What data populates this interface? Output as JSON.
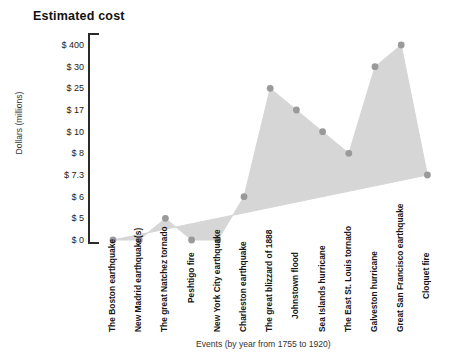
{
  "chart_data": {
    "type": "area",
    "title": "Estimated cost",
    "ylabel": "Dollars (millions)",
    "xlabel": "Events (by year from 1755 to 1920)",
    "ytick_labels": [
      "$ 400",
      "$ 30",
      "$ 25",
      "$ 17",
      "$ 10",
      "$ 8",
      "$ 7.3",
      "$ 6",
      "$ 5",
      "$ 0"
    ],
    "ytick_values": [
      400,
      30,
      25,
      17,
      10,
      8,
      7.3,
      6,
      5,
      0
    ],
    "scale_note": "ordinal / non-linear y axis: ticks evenly spaced",
    "grid": false,
    "legend": "none",
    "categories": [
      "The Boston earthquake",
      "New Madrid earthquake(s)",
      "The great Natchez tornado",
      "Peshtigo fire",
      "New York City earthquake",
      "Charleston earthquake",
      "The great blizzard of 1888",
      "Johnstown flood",
      "Sea Islands hurricane",
      "The East St. Louis tornado",
      "Galveston hurricane",
      "Great San Francisco earthquake",
      "Cloquet fire"
    ],
    "values": [
      0,
      0,
      5,
      0,
      0,
      6,
      25,
      17,
      10,
      8,
      30,
      400,
      7.3
    ],
    "value_labels": [
      "$ 0",
      "$ 0",
      "$ 5",
      "$ 0",
      "$ 0",
      "$ 6",
      "$ 25",
      "$ 17",
      "$ 10",
      "$ 8",
      "$ 30",
      "$ 400",
      "$ 7.3"
    ],
    "marker_color": "#9a9a9a",
    "fill_color": "#d6d6d6",
    "axis_color": "#2b2b2b"
  }
}
